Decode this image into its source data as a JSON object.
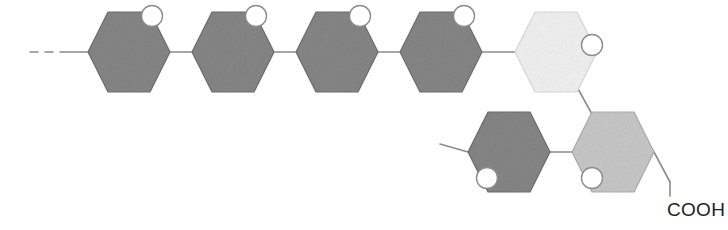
{
  "figure": {
    "background_color": "#ffffff",
    "width": 728,
    "height": 230
  },
  "palette": {
    "ring_dark_fill": "#878787",
    "ring_dark_stroke": "#6f6f6f",
    "ring_medium_fill": "#c9c9c9",
    "ring_medium_stroke": "#b0b0b0",
    "ring_light_fill": "#f3f3f3",
    "ring_light_stroke": "#dcdcdc",
    "bond_stroke": "#8c8c8c",
    "bond_stroke_dark": "#6f6f6f",
    "oxygen_fill": "#ffffff",
    "oxygen_stroke": "#8c8c8c",
    "wedge_fill": "#9a9a9a",
    "label_color": "#231f20"
  },
  "geometry": {
    "ring_half_width": 41,
    "ring_half_height": 40,
    "ring_inset": 20,
    "oxygen_radius": 10.5
  },
  "rings": [
    {
      "id": "ring-1",
      "name": "sugar-ring-1",
      "shade": "dark",
      "cx": 129,
      "cy": 52,
      "oxygen": {
        "position": "top-right",
        "ox": 152,
        "oy": 16
      }
    },
    {
      "id": "ring-2",
      "name": "sugar-ring-2",
      "shade": "dark",
      "cx": 233,
      "cy": 52,
      "oxygen": {
        "position": "top-right",
        "ox": 256,
        "oy": 16
      }
    },
    {
      "id": "ring-3",
      "name": "sugar-ring-3",
      "shade": "dark",
      "cx": 337,
      "cy": 52,
      "oxygen": {
        "position": "top-right",
        "ox": 360,
        "oy": 16
      }
    },
    {
      "id": "ring-4",
      "name": "sugar-ring-4",
      "shade": "dark",
      "cx": 441,
      "cy": 52,
      "oxygen": {
        "position": "top-right",
        "ox": 464,
        "oy": 16
      }
    },
    {
      "id": "ring-5",
      "name": "sugar-ring-5-highlighted",
      "shade": "light",
      "cx": 556,
      "cy": 52,
      "oxygen": {
        "position": "right",
        "ox": 592,
        "oy": 45
      }
    },
    {
      "id": "ring-6",
      "name": "sugar-ring-6",
      "shade": "dark",
      "cx": 509,
      "cy": 152,
      "oxygen": {
        "position": "bottom-left",
        "ox": 487,
        "oy": 178
      }
    },
    {
      "id": "ring-7",
      "name": "sugar-ring-7",
      "shade": "medium",
      "cx": 613,
      "cy": 152,
      "oxygen": {
        "position": "bottom-left",
        "ox": 592,
        "oy": 178
      }
    }
  ],
  "bonds": [
    {
      "name": "chain-continuation-dash-1",
      "type": "dash",
      "x1": 30,
      "y1": 52,
      "x2": 38,
      "y2": 52
    },
    {
      "name": "chain-continuation-dash-2",
      "type": "dash",
      "x1": 45,
      "y1": 52,
      "x2": 53,
      "y2": 52
    },
    {
      "name": "bond-open-end-to-ring-1",
      "type": "line",
      "x1": 60,
      "y1": 52,
      "x2": 88,
      "y2": 52
    },
    {
      "name": "glycosidic-bond-1-2",
      "type": "line",
      "x1": 170,
      "y1": 52,
      "x2": 192,
      "y2": 52
    },
    {
      "name": "glycosidic-bond-2-3",
      "type": "line",
      "x1": 274,
      "y1": 52,
      "x2": 296,
      "y2": 52
    },
    {
      "name": "glycosidic-bond-3-4",
      "type": "line",
      "x1": 378,
      "y1": 52,
      "x2": 400,
      "y2": 52
    },
    {
      "name": "glycosidic-bond-4-5",
      "type": "line",
      "x1": 482,
      "y1": 52,
      "x2": 515,
      "y2": 52
    },
    {
      "name": "branch-bond-5-7",
      "type": "line",
      "x1": 577,
      "y1": 87,
      "x2": 593,
      "y2": 116
    },
    {
      "name": "glycosidic-bond-6-7",
      "type": "line",
      "x1": 550,
      "y1": 152,
      "x2": 572,
      "y2": 152
    },
    {
      "name": "bond-ring-6-open-end",
      "type": "line",
      "x1": 440,
      "y1": 144,
      "x2": 468,
      "y2": 152
    },
    {
      "name": "bond-ring-7-to-cooh",
      "type": "line",
      "x1": 654,
      "y1": 152,
      "x2": 670,
      "y2": 182
    },
    {
      "name": "cooh-stem",
      "type": "line",
      "x1": 670,
      "y1": 182,
      "x2": 670,
      "y2": 196
    }
  ],
  "wedge": {
    "name": "stereo-wedge-bond",
    "tip_x": 578,
    "tip_y": 18,
    "base_x": 538,
    "base_y": 61,
    "base_half_width": 4.5,
    "dot_radius": 6.0
  },
  "labels": [
    {
      "name": "cooh-label",
      "text": "COOH",
      "x": 667,
      "y": 216,
      "anchor": "start"
    }
  ]
}
